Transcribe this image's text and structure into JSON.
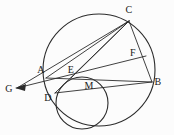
{
  "figure": {
    "type": "geometry-diagram",
    "width": 174,
    "height": 135,
    "background_color": "#fcfcfc",
    "stroke_color": "#2b2b2b",
    "label_color": "#1a1a1a"
  },
  "points": [
    {
      "id": "A",
      "label": "A",
      "x": 46,
      "y": 78,
      "label_x": 41,
      "label_y": 70
    },
    {
      "id": "B",
      "label": "B",
      "x": 152,
      "y": 82,
      "label_x": 158,
      "label_y": 82
    },
    {
      "id": "C",
      "label": "C",
      "x": 129,
      "y": 21,
      "label_x": 129,
      "label_y": 10
    },
    {
      "id": "D",
      "label": "D",
      "x": 55,
      "y": 93,
      "label_x": 48,
      "label_y": 98
    },
    {
      "id": "E",
      "label": "E",
      "x": 71,
      "y": 78,
      "label_x": 71,
      "label_y": 70
    },
    {
      "id": "F",
      "label": "F",
      "x": 138,
      "y": 60,
      "label_x": 133,
      "label_y": 53
    },
    {
      "id": "G",
      "label": "G",
      "x": 17,
      "y": 88,
      "label_x": 9,
      "label_y": 89
    },
    {
      "id": "M",
      "label": "M",
      "x": 88,
      "y": 88,
      "label_x": 89,
      "label_y": 86
    }
  ],
  "circles": [
    {
      "id": "large-circle",
      "cx": 99,
      "cy": 70,
      "r": 56
    },
    {
      "id": "small-circle",
      "cx": 82,
      "cy": 103,
      "r": 26
    }
  ],
  "segments": [
    {
      "id": "G-to-C",
      "from": "G",
      "to": "C"
    },
    {
      "id": "G-to-F",
      "from": "G",
      "to": "F"
    },
    {
      "id": "A-to-B",
      "from": "A",
      "to": "B"
    },
    {
      "id": "A-to-C",
      "from": "A",
      "to": "C"
    },
    {
      "id": "C-to-B",
      "from": "C",
      "to": "B"
    },
    {
      "id": "C-to-D",
      "from": "C",
      "to": "D"
    },
    {
      "id": "C-to-E",
      "from": "C",
      "to": "E"
    },
    {
      "id": "D-to-B",
      "from": "D",
      "to": "B"
    }
  ],
  "arrows": [
    {
      "id": "arrow-to-G",
      "points_to": "G"
    }
  ]
}
